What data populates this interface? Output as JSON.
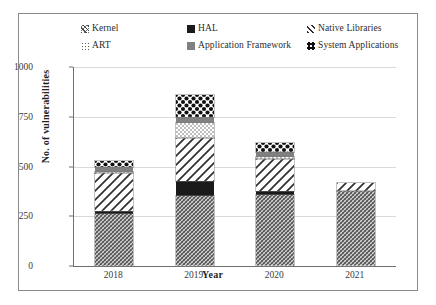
{
  "chart_data": {
    "type": "bar",
    "stacked": true,
    "title": "",
    "xlabel": "Year",
    "ylabel": "No. of vulnerabilities",
    "categories": [
      "2018",
      "2019",
      "2020",
      "2021"
    ],
    "ylim": [
      0,
      1000
    ],
    "yticks": [
      0,
      250,
      500,
      750,
      1000
    ],
    "grid": true,
    "legend_position": "top",
    "series": [
      {
        "name": "Kernel",
        "pattern": "dense-diagonal-crosshatch",
        "values": [
          260,
          350,
          355,
          375
        ]
      },
      {
        "name": "HAL",
        "pattern": "solid-black",
        "values": [
          15,
          75,
          20,
          0
        ]
      },
      {
        "name": "Native Libraries",
        "pattern": "wide-diagonal-hatch",
        "values": [
          190,
          220,
          165,
          40
        ]
      },
      {
        "name": "ART",
        "pattern": "fine-dots",
        "values": [
          10,
          75,
          10,
          0
        ]
      },
      {
        "name": "Application Framework",
        "pattern": "solid-gray",
        "values": [
          25,
          30,
          25,
          0
        ]
      },
      {
        "name": "System Applications",
        "pattern": "bold-dot-grid",
        "values": [
          30,
          110,
          45,
          0
        ]
      }
    ],
    "totals": [
      530,
      860,
      620,
      415
    ],
    "colors": {
      "hal": "#1a1a1a",
      "application_framework": "#808080",
      "grid": "#d9d9d9",
      "axis": "#6f6f6f",
      "border": "#8a8a8a",
      "text": "#2b2b2b"
    }
  },
  "legend": {
    "columns": [
      {
        "items": [
          {
            "label": "Kernel",
            "marker": "kernel-swatch"
          },
          {
            "label": "ART",
            "marker": "art-swatch"
          }
        ]
      },
      {
        "items": [
          {
            "label": "HAL",
            "marker": "hal-swatch"
          },
          {
            "label": "Application Framework",
            "marker": "application-framework-swatch"
          }
        ]
      },
      {
        "items": [
          {
            "label": "Native Libraries",
            "marker": "native-libraries-swatch"
          },
          {
            "label": "System Applications",
            "marker": "system-applications-swatch"
          }
        ]
      }
    ]
  },
  "axes": {
    "y": {
      "title": "No. of vulnerabilities",
      "ticks": [
        "1000",
        "750",
        "500",
        "250",
        "0"
      ]
    },
    "x": {
      "title": "Year",
      "ticks": [
        "2018",
        "2019",
        "2020",
        "2021"
      ]
    }
  }
}
